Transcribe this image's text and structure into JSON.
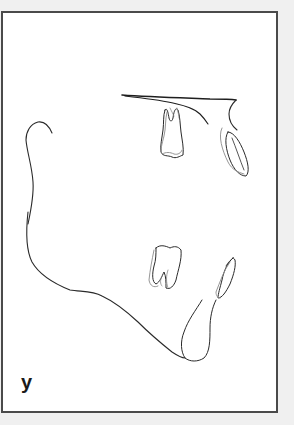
{
  "figure": {
    "panel_label": "y",
    "colors": {
      "background": "#f0f0f0",
      "frame": "#4a4a4a",
      "panel": "#ffffff",
      "primary_line": "#2a2a2a",
      "secondary_line": "#8a8a8a"
    },
    "structures": [
      {
        "name": "palatal-plane"
      },
      {
        "name": "anterior-maxilla"
      },
      {
        "name": "upper-molar"
      },
      {
        "name": "upper-incisor"
      },
      {
        "name": "ramus-condyle"
      },
      {
        "name": "mandible-border"
      },
      {
        "name": "lower-molar"
      },
      {
        "name": "lower-incisor"
      },
      {
        "name": "symphysis"
      }
    ]
  }
}
